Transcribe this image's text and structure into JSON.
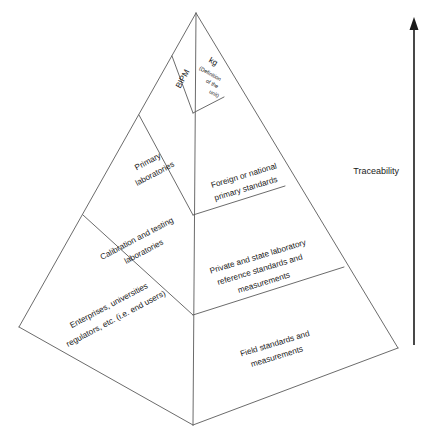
{
  "diagram": {
    "type": "pyramid-hierarchy",
    "background_color": "#ffffff",
    "line_color": "#5a5a5a",
    "text_color": "#1a1a1a",
    "axis": {
      "label": "Traceability",
      "direction": "up",
      "arrow_color": "#1a1a1a"
    },
    "levels": [
      {
        "index": 1,
        "position": "top",
        "left_face_label": "BIPM",
        "right_face_label_main": "kg",
        "right_face_label_sub_line1": "(Definition",
        "right_face_label_sub_line2": "of the",
        "right_face_label_sub_line3": "unit)"
      },
      {
        "index": 2,
        "position": "upper-middle",
        "left_face_label_line1": "Primary",
        "left_face_label_line2": "laboratories",
        "right_face_label_line1": "Foreign or national",
        "right_face_label_line2": "primary standards"
      },
      {
        "index": 3,
        "position": "lower-middle",
        "left_face_label_line1": "Calibration and testing",
        "left_face_label_line2": "laboratories",
        "right_face_label_line1": "Private and state laboratory",
        "right_face_label_line2": "reference standards and",
        "right_face_label_line3": "measurements"
      },
      {
        "index": 4,
        "position": "bottom",
        "left_face_label_line1": "Enterprises, universities",
        "left_face_label_line2": "regulators, etc. (i.e. end users)",
        "right_face_label_line1": "Field standards and",
        "right_face_label_line2": "measurements"
      }
    ]
  }
}
